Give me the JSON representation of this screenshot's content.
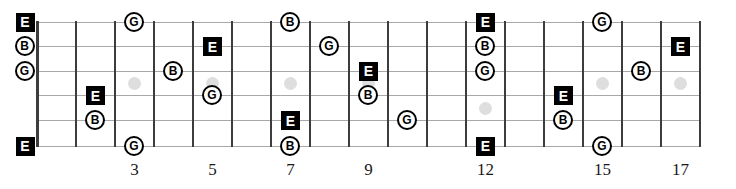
{
  "diagram_type": "guitar-fretboard-note-map",
  "fretboard": {
    "string_count": 6,
    "fret_count": 17,
    "fret_number_labels": [
      {
        "fret": 3,
        "label": "3"
      },
      {
        "fret": 5,
        "label": "5"
      },
      {
        "fret": 7,
        "label": "7"
      },
      {
        "fret": 9,
        "label": "9"
      },
      {
        "fret": 12,
        "label": "12"
      },
      {
        "fret": 15,
        "label": "15"
      },
      {
        "fret": 17,
        "label": "17"
      }
    ],
    "inlay_dots": [
      {
        "fret": 3,
        "gap": "3-4"
      },
      {
        "fret": 5,
        "gap": "3-4"
      },
      {
        "fret": 7,
        "gap": "3-4"
      },
      {
        "fret": 9,
        "gap": "3-4"
      },
      {
        "fret": 12,
        "gap": "4-5"
      },
      {
        "fret": 15,
        "gap": "3-4"
      },
      {
        "fret": 17,
        "gap": "3-4"
      }
    ],
    "notes": [
      {
        "string": 1,
        "fret": 0,
        "note": "E"
      },
      {
        "string": 1,
        "fret": 3,
        "note": "G"
      },
      {
        "string": 1,
        "fret": 7,
        "note": "B"
      },
      {
        "string": 1,
        "fret": 12,
        "note": "E"
      },
      {
        "string": 1,
        "fret": 15,
        "note": "G"
      },
      {
        "string": 2,
        "fret": 0,
        "note": "B"
      },
      {
        "string": 2,
        "fret": 5,
        "note": "E"
      },
      {
        "string": 2,
        "fret": 8,
        "note": "G"
      },
      {
        "string": 2,
        "fret": 12,
        "note": "B"
      },
      {
        "string": 2,
        "fret": 17,
        "note": "E"
      },
      {
        "string": 3,
        "fret": 0,
        "note": "G"
      },
      {
        "string": 3,
        "fret": 4,
        "note": "B"
      },
      {
        "string": 3,
        "fret": 9,
        "note": "E"
      },
      {
        "string": 3,
        "fret": 12,
        "note": "G"
      },
      {
        "string": 3,
        "fret": 16,
        "note": "B"
      },
      {
        "string": 4,
        "fret": 2,
        "note": "E"
      },
      {
        "string": 4,
        "fret": 5,
        "note": "G"
      },
      {
        "string": 4,
        "fret": 9,
        "note": "B"
      },
      {
        "string": 4,
        "fret": 14,
        "note": "E"
      },
      {
        "string": 5,
        "fret": 2,
        "note": "B"
      },
      {
        "string": 5,
        "fret": 7,
        "note": "E"
      },
      {
        "string": 5,
        "fret": 10,
        "note": "G"
      },
      {
        "string": 5,
        "fret": 14,
        "note": "B"
      },
      {
        "string": 6,
        "fret": 0,
        "note": "E"
      },
      {
        "string": 6,
        "fret": 3,
        "note": "G"
      },
      {
        "string": 6,
        "fret": 7,
        "note": "B"
      },
      {
        "string": 6,
        "fret": 12,
        "note": "E"
      },
      {
        "string": 6,
        "fret": 15,
        "note": "G"
      }
    ],
    "marker_styles": {
      "E": {
        "shape": "square",
        "fill": "#000000",
        "text_color": "#ffffff"
      },
      "B": {
        "shape": "circle",
        "fill": "#ffffff",
        "border": "#000000",
        "text_color": "#000000"
      },
      "G": {
        "shape": "circle",
        "fill": "#ffffff",
        "border": "#000000",
        "text_color": "#000000"
      }
    }
  },
  "colors": {
    "background": "#ffffff",
    "string_line": "#a8a8a8",
    "fret_line": "#3d3d3d",
    "nut_line": "#3d3d3d",
    "inlay_dot": "#dedede",
    "fret_number_text": "#1a1a1a"
  }
}
